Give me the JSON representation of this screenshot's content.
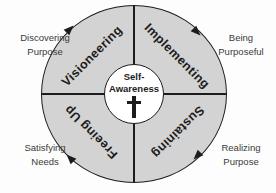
{
  "diagram": {
    "flow_direction": "clockwise",
    "center": {
      "line1": "Self-",
      "line2": "Awareness"
    },
    "quadrants": [
      {
        "id": "visioneering",
        "label": "Visioneering",
        "position": "top-left"
      },
      {
        "id": "implementing",
        "label": "Implementing",
        "position": "top-right"
      },
      {
        "id": "sustaining",
        "label": "Sustaining",
        "position": "bottom-right"
      },
      {
        "id": "freeing-up",
        "label": "Freeing Up",
        "position": "bottom-left"
      }
    ],
    "outer_labels": [
      {
        "id": "discovering-purpose",
        "line1": "Discovering",
        "line2": "Purpose",
        "position": "top-left"
      },
      {
        "id": "being-purposeful",
        "line1": "Being",
        "line2": "Purposeful",
        "position": "top-right"
      },
      {
        "id": "satisfying-needs",
        "line1": "Satisfying",
        "line2": "Needs",
        "position": "bottom-left"
      },
      {
        "id": "realizing-purpose",
        "line1": "Realizing",
        "line2": "Purpose",
        "position": "bottom-right"
      }
    ],
    "icons": {
      "cross": "latin-cross",
      "flow_arrow": "triangle-arrowhead"
    },
    "colors": {
      "quadrant_fill": "#d3d3d3",
      "stroke": "#1c1c1c",
      "center_fill": "#ffffff",
      "outer_text": "#3a3a3a",
      "background": "#fdfdfd"
    }
  }
}
